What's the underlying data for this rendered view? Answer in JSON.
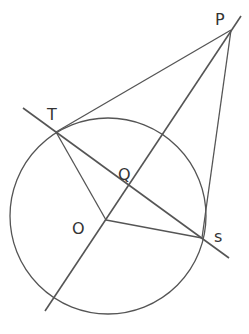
{
  "diagram": {
    "title": "",
    "colors": {
      "stroke": "#555555",
      "label": "#333333",
      "background": "#ffffff"
    },
    "circle": {
      "center": "O",
      "cx": 108,
      "cy": 216,
      "r": 98
    },
    "points": {
      "P": {
        "label": "P",
        "x": 231,
        "y": 30
      },
      "T": {
        "label": "T",
        "x": 56,
        "y": 132
      },
      "S": {
        "label": "S",
        "x": 202,
        "y": 238
      },
      "Q": {
        "label": "Q",
        "x": 129,
        "y": 184
      },
      "O": {
        "label": "O",
        "x": 106,
        "y": 220
      }
    },
    "labels": {
      "P": "P",
      "T": "T",
      "S": "s",
      "Q": "Q",
      "O": "O"
    },
    "segments": [
      {
        "name": "tangent-PT",
        "from": "P",
        "to": "T"
      },
      {
        "name": "tangent-PS",
        "from": "P",
        "to": "S"
      },
      {
        "name": "radius-OT",
        "from": "O",
        "to": "T"
      },
      {
        "name": "radius-OS",
        "from": "O",
        "to": "S"
      },
      {
        "name": "line-OP-extended",
        "from": "P",
        "to": "O",
        "extended": true
      },
      {
        "name": "chord-TS-extended",
        "from": "T",
        "to": "S",
        "extended": true
      }
    ]
  }
}
